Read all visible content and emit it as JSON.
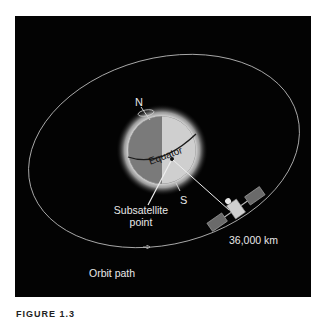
{
  "figure": {
    "caption": "FIGURE 1.3",
    "colors": {
      "background": "#030303",
      "globe_dark_half": "#7a7a7a",
      "globe_light_half": "#cfcfcf",
      "glow": "#e6e6e6",
      "orbit": "#bfbfbf",
      "text": "#e8e8e8"
    },
    "labels": {
      "north": "N",
      "south": "S",
      "equator": "Equator",
      "subsatellite_line1": "Subsatellite",
      "subsatellite_line2": "point",
      "altitude": "36,000 km",
      "orbit": "Orbit path"
    }
  }
}
